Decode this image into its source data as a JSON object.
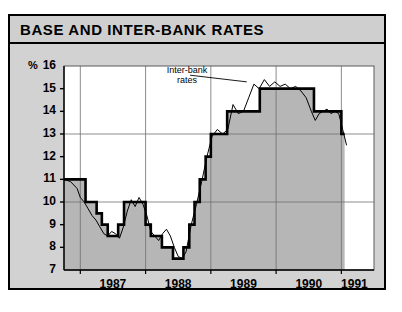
{
  "header": {
    "title": "BASE AND INTER-BANK RATES"
  },
  "chart_data": {
    "type": "line",
    "title": "BASE AND INTER-BANK RATES",
    "xlabel": "",
    "ylabel": "%",
    "unit_label": "%",
    "ylim": [
      7,
      16
    ],
    "xlim": [
      1986.75,
      1991.5
    ],
    "yticks": [
      7,
      8,
      9,
      10,
      11,
      12,
      13,
      14,
      15,
      16
    ],
    "ytick_labels": [
      "7",
      "8",
      "9",
      "10",
      "11",
      "12",
      "13",
      "14",
      "15",
      "16"
    ],
    "gridlines_y": [
      10,
      13
    ],
    "gridlines_x": [
      1987.0,
      1988.0,
      1989.0,
      1990.0,
      1991.0
    ],
    "xtick_labels": [
      "1987",
      "1988",
      "1989",
      "1990",
      "1991"
    ],
    "xtick_centers": [
      1987.5,
      1988.5,
      1989.5,
      1990.5,
      1991.2
    ],
    "grid": true,
    "legend": "none",
    "fill": "below-curve-gray",
    "annotations": [
      {
        "text_line1": "Inter-bank",
        "text_line2": "rates",
        "x": 1988.62,
        "y": 15.55,
        "leader_to_x": 1989.55,
        "leader_to_y": 15.3
      }
    ],
    "series": [
      {
        "name": "Base rate",
        "style": "thick-step",
        "color": "#000000",
        "linewidth": 2.6,
        "x": [
          1986.75,
          1986.92,
          1987.0,
          1987.08,
          1987.17,
          1987.25,
          1987.33,
          1987.42,
          1987.5,
          1987.58,
          1987.67,
          1987.75,
          1987.83,
          1987.92,
          1988.0,
          1988.08,
          1988.17,
          1988.25,
          1988.33,
          1988.42,
          1988.5,
          1988.58,
          1988.67,
          1988.75,
          1988.83,
          1988.92,
          1989.0,
          1989.08,
          1989.17,
          1989.25,
          1989.42,
          1989.58,
          1989.75,
          1989.92,
          1990.0,
          1990.17,
          1990.33,
          1990.5,
          1990.58,
          1990.67,
          1990.75,
          1990.83,
          1990.92,
          1991.0,
          1991.05
        ],
        "values": [
          11.0,
          11.0,
          11.0,
          10.0,
          10.0,
          9.5,
          9.0,
          8.5,
          8.5,
          9.0,
          10.0,
          10.0,
          10.0,
          10.0,
          9.0,
          8.5,
          8.5,
          8.0,
          8.0,
          7.5,
          7.5,
          8.0,
          9.0,
          10.0,
          11.0,
          12.0,
          13.0,
          13.0,
          13.0,
          14.0,
          14.0,
          14.0,
          15.0,
          15.0,
          15.0,
          15.0,
          15.0,
          15.0,
          14.0,
          14.0,
          14.0,
          14.0,
          14.0,
          13.0,
          13.0
        ]
      },
      {
        "name": "Inter-bank rates",
        "style": "thin",
        "color": "#000000",
        "linewidth": 1.0,
        "x": [
          1986.75,
          1986.85,
          1986.95,
          1987.0,
          1987.06,
          1987.12,
          1987.18,
          1987.24,
          1987.3,
          1987.36,
          1987.42,
          1987.48,
          1987.54,
          1987.6,
          1987.66,
          1987.72,
          1987.78,
          1987.84,
          1987.9,
          1987.96,
          1988.02,
          1988.08,
          1988.14,
          1988.2,
          1988.26,
          1988.32,
          1988.38,
          1988.44,
          1988.5,
          1988.56,
          1988.62,
          1988.7,
          1988.78,
          1988.86,
          1988.94,
          1989.02,
          1989.1,
          1989.18,
          1989.26,
          1989.34,
          1989.42,
          1989.5,
          1989.58,
          1989.66,
          1989.74,
          1989.82,
          1989.9,
          1989.98,
          1990.06,
          1990.14,
          1990.22,
          1990.3,
          1990.38,
          1990.46,
          1990.54,
          1990.6,
          1990.66,
          1990.72,
          1990.78,
          1990.84,
          1990.9,
          1990.96,
          1991.02,
          1991.08
        ],
        "values": [
          11.0,
          10.9,
          10.6,
          10.2,
          10.0,
          9.7,
          9.4,
          9.2,
          8.9,
          8.6,
          8.5,
          8.7,
          8.6,
          8.4,
          8.9,
          9.6,
          10.1,
          9.8,
          10.2,
          9.9,
          9.4,
          8.7,
          8.5,
          8.3,
          8.6,
          8.8,
          8.5,
          8.0,
          7.6,
          7.5,
          7.8,
          9.0,
          9.9,
          10.9,
          12.0,
          12.9,
          13.2,
          13.0,
          13.2,
          14.3,
          13.9,
          14.0,
          14.6,
          15.2,
          15.0,
          15.4,
          15.1,
          15.3,
          15.1,
          15.2,
          15.0,
          15.1,
          14.9,
          14.6,
          14.0,
          13.6,
          13.9,
          14.0,
          14.1,
          13.9,
          14.0,
          13.9,
          13.2,
          12.5
        ]
      }
    ]
  }
}
